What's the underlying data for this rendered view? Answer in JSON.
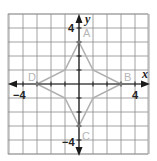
{
  "diagram": {
    "type": "coordinate-plane",
    "grid": {
      "xmin": -5,
      "xmax": 5,
      "ymin": -5,
      "ymax": 5,
      "step": 1
    },
    "axes": {
      "x_label": "x",
      "y_label": "y"
    },
    "tick_labels": {
      "x_pos": "4",
      "x_neg": "−4",
      "y_pos": "4",
      "y_neg": "−4"
    },
    "points": [
      {
        "name": "A",
        "x": 0,
        "y": 3
      },
      {
        "name": "B",
        "x": 3,
        "y": 0
      },
      {
        "name": "C",
        "x": 0,
        "y": -3
      },
      {
        "name": "D",
        "x": -3,
        "y": 0
      }
    ],
    "polygon": [
      [
        0,
        3
      ],
      [
        1,
        1
      ],
      [
        3,
        0
      ],
      [
        1,
        -1
      ],
      [
        0,
        -3
      ],
      [
        -1,
        -1
      ],
      [
        -3,
        0
      ],
      [
        -1,
        1
      ]
    ],
    "colors": {
      "grid": "#8a8a8a",
      "axis": "#1a1a1a",
      "shape": "#b0b0b0",
      "label": "#b5b5b5"
    }
  }
}
